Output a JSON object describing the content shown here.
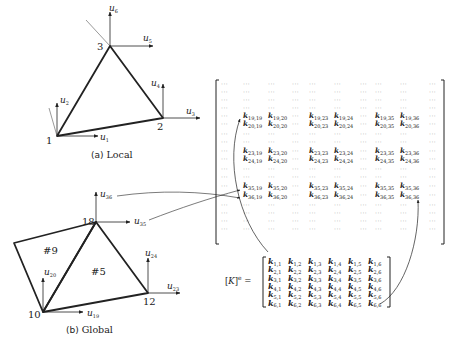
{
  "local": {
    "caption_prefix": "(a)",
    "caption_text": "Local",
    "nodes": [
      {
        "id": "1",
        "x": 57,
        "y": 136
      },
      {
        "id": "2",
        "x": 163,
        "y": 118
      },
      {
        "id": "3",
        "x": 110,
        "y": 46
      }
    ],
    "dofs": [
      "u1",
      "u2",
      "u3",
      "u4",
      "u5",
      "u6"
    ]
  },
  "global": {
    "caption_prefix": "(b)",
    "caption_text": "Global",
    "nodes": [
      {
        "id": "10",
        "x": 43,
        "y": 312
      },
      {
        "id": "12",
        "x": 148,
        "y": 293
      },
      {
        "id": "18",
        "x": 96,
        "y": 222
      }
    ],
    "elements": [
      "#9",
      "#5"
    ],
    "dofs": [
      "u19",
      "u20",
      "u23",
      "u24",
      "u35",
      "u36"
    ]
  },
  "global_matrix": {
    "row_indices": [
      19,
      20,
      23,
      24,
      35,
      36
    ],
    "col_indices": [
      19,
      20,
      23,
      24,
      35,
      36
    ],
    "ellipsis": "···",
    "entries": [
      [
        "k19,19",
        "k19,20",
        "k19,23",
        "k19,24",
        "k19,35",
        "k19,36"
      ],
      [
        "k20,19",
        "k20,20",
        "k20,23",
        "k20,24",
        "k20,35",
        "k20,36"
      ],
      [
        "k23,19",
        "k23,20",
        "k23,23",
        "k23,24",
        "k23,35",
        "k23,36"
      ],
      [
        "k24,19",
        "k24,20",
        "k24,23",
        "k24,24",
        "k24,35",
        "k24,36"
      ],
      [
        "k35,19",
        "k35,20",
        "k35,23",
        "k35,24",
        "k35,35",
        "k35,36"
      ],
      [
        "k36,19",
        "k36,20",
        "k36,23",
        "k36,24",
        "k36,35",
        "k36,36"
      ]
    ]
  },
  "element_matrix": {
    "label": "[K]e =",
    "size": 6,
    "entries": [
      [
        "k1,1",
        "k1,2",
        "k1,3",
        "k1,4",
        "k1,5",
        "k1,6"
      ],
      [
        "k2,1",
        "k2,2",
        "k2,3",
        "k2,4",
        "k2,5",
        "k2,6"
      ],
      [
        "k3,1",
        "k3,2",
        "k3,3",
        "k3,4",
        "k3,5",
        "k3,6"
      ],
      [
        "k4,1",
        "k4,2",
        "k4,3",
        "k4,4",
        "k4,5",
        "k4,6"
      ],
      [
        "k5,1",
        "k5,2",
        "k5,3",
        "k5,4",
        "k5,5",
        "k5,6"
      ],
      [
        "k6,1",
        "k6,2",
        "k6,3",
        "k6,4",
        "k6,5",
        "k6,6"
      ]
    ]
  },
  "mappings": [
    {
      "from": "u36",
      "to": "row 36"
    },
    {
      "from": "u35",
      "to": "row 35"
    },
    {
      "from": "k1,1",
      "to": "k19,19"
    },
    {
      "from": "k6,6",
      "to": "k36,36"
    }
  ]
}
